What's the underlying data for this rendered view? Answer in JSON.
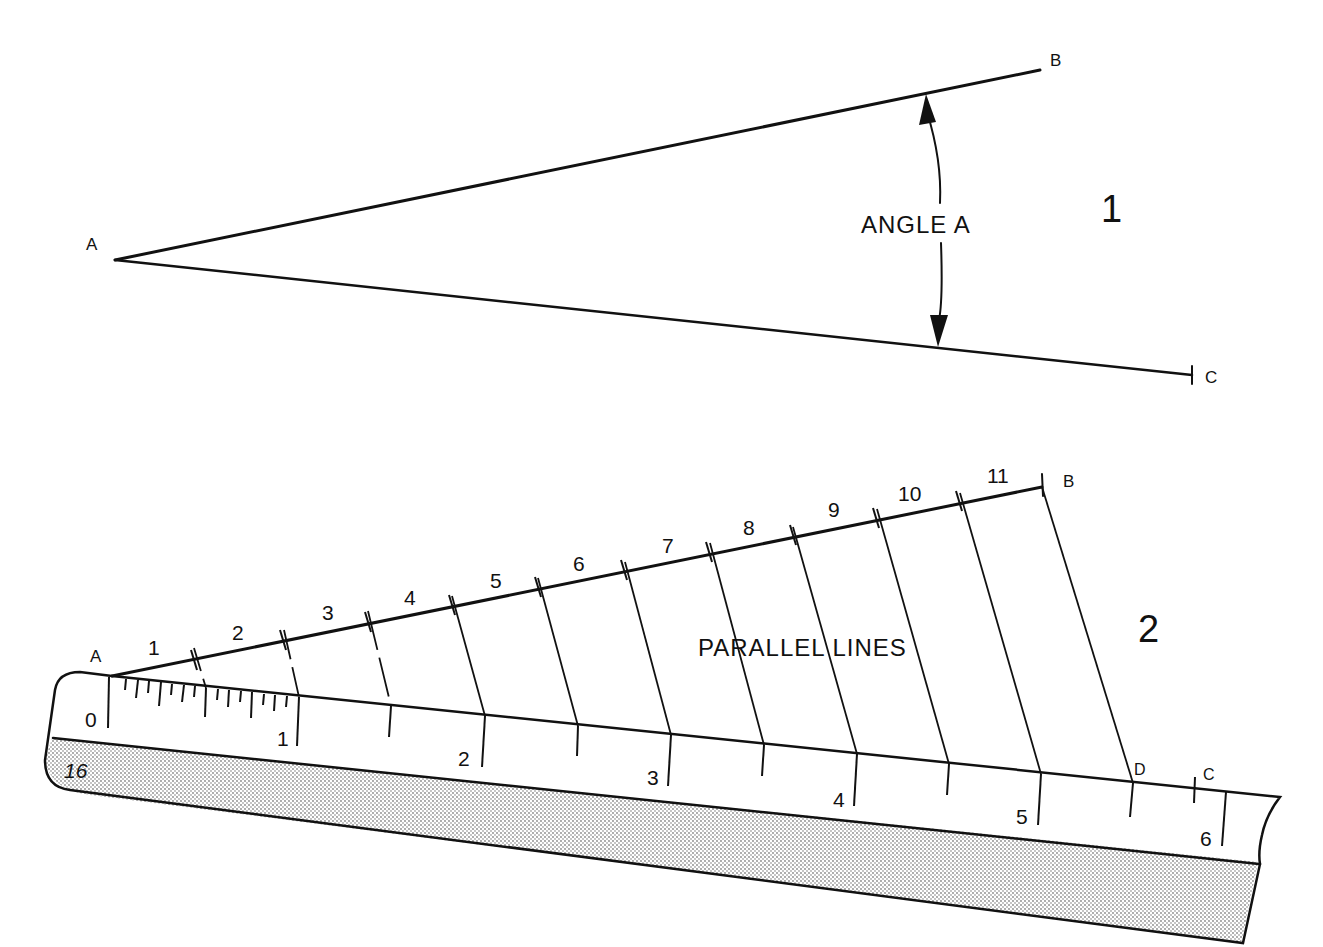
{
  "figure1": {
    "number": "1",
    "point_labels": {
      "a": "A",
      "b": "B",
      "c": "C"
    },
    "angle_label": "ANGLE A"
  },
  "figure2": {
    "number": "2",
    "point_labels": {
      "a": "A",
      "b": "B",
      "c": "C",
      "d": "D"
    },
    "divisions_label": "PARALLEL LINES",
    "ab_divisions": [
      "1",
      "2",
      "3",
      "4",
      "5",
      "6",
      "7",
      "8",
      "9",
      "10",
      "11"
    ],
    "ruler_scale": [
      "0",
      "1",
      "2",
      "3",
      "4",
      "5",
      "6"
    ],
    "ruler_scale_id": "16"
  },
  "colors": {
    "ink": "#111111",
    "paper": "#ffffff",
    "ruler_shade": "#d9d9d9"
  }
}
